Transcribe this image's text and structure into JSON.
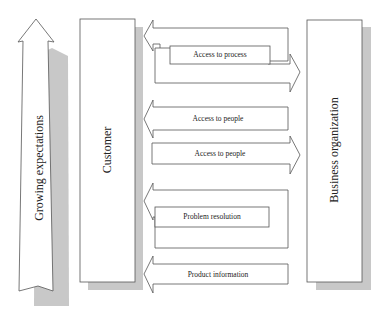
{
  "diagram": {
    "left_arrow": {
      "label": "Growing expectations",
      "direction": "up"
    },
    "customer_box": {
      "label": "Customer"
    },
    "business_box": {
      "label": "Business organization"
    },
    "flows": [
      {
        "label": "Access to process",
        "direction": "bidirectional"
      },
      {
        "label": "Access to people",
        "direction": "to-customer"
      },
      {
        "label": "Access to people",
        "direction": "to-business"
      },
      {
        "label": "Problem resolution",
        "direction": "to-customer"
      },
      {
        "label": "Product information",
        "direction": "to-customer"
      }
    ],
    "colors": {
      "stroke": "#555555",
      "shadow": "#c8c8c8",
      "fill": "#ffffff"
    }
  }
}
